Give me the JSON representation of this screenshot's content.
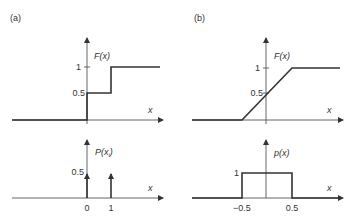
{
  "panels": {
    "a": {
      "label": "(a)",
      "top": {
        "ylabel": "F(x)",
        "xlabel": "x",
        "yticks": [
          "1",
          "0.5"
        ]
      },
      "bottom": {
        "ylabel": "P(x",
        "ylabel_sub": "i",
        "ylabel_close": ")",
        "xlabel": "x",
        "yticks": [
          "0.5"
        ],
        "xticks": [
          "0",
          "1"
        ]
      }
    },
    "b": {
      "label": "(b)",
      "top": {
        "ylabel": "F(x)",
        "xlabel": "x",
        "yticks": [
          "1",
          "0.5"
        ]
      },
      "bottom": {
        "ylabel": "p(x)",
        "xlabel": "x",
        "yticks": [
          "1"
        ],
        "xticks": [
          "−0.5",
          "0.5"
        ]
      }
    }
  },
  "colors": {
    "line": "#333333",
    "axis": "#555555",
    "text": "#333333"
  }
}
